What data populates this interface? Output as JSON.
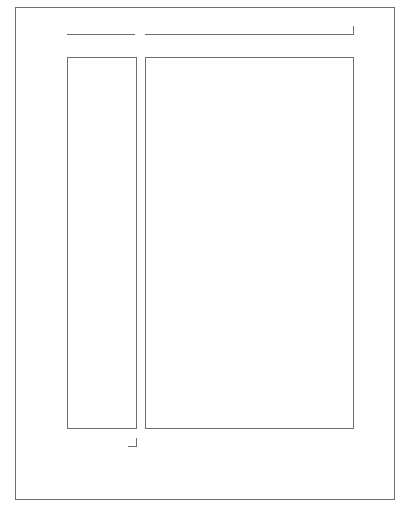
{
  "diagram": {
    "type": "page-layout-wireframe",
    "canvas": {
      "width": 410,
      "height": 508,
      "background": "#ffffff"
    },
    "stroke_color": "#6e6e6e",
    "regions": [
      {
        "id": "page-frame",
        "label": ""
      },
      {
        "id": "header-left-rule",
        "label": ""
      },
      {
        "id": "header-right-rule",
        "label": ""
      },
      {
        "id": "sidebar-column",
        "label": ""
      },
      {
        "id": "main-column",
        "label": ""
      },
      {
        "id": "corner-mark",
        "label": ""
      }
    ]
  }
}
